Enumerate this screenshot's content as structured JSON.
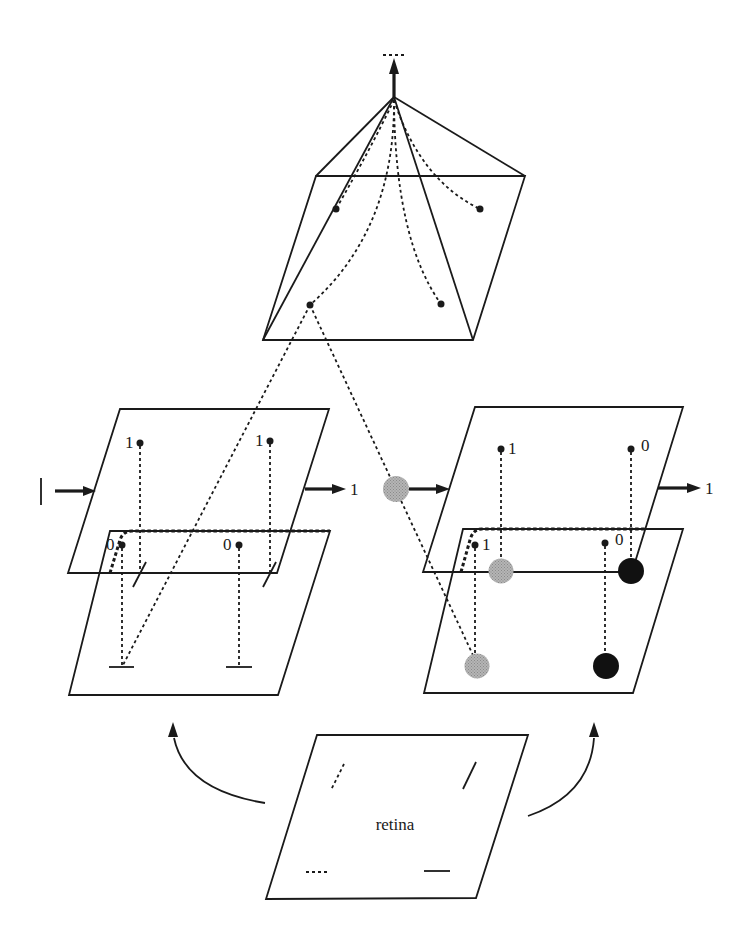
{
  "figure": {
    "type": "hierarchical feature-detection network diagram",
    "colors": {
      "ink": "#1a1a1a",
      "grey_unit": "#a8a8a8",
      "black_unit": "#111111",
      "background": "#ffffff"
    }
  },
  "pyramid": {
    "label": "top-level integrating unit",
    "output_symbol": "- - -"
  },
  "left_module": {
    "input_symbol": "|",
    "output_label": "1",
    "upper_plane_labels": [
      "1",
      "1"
    ],
    "lower_plane_labels": [
      "0",
      "0"
    ]
  },
  "right_module": {
    "input_symbol": "grey unit",
    "output_label": "1",
    "upper_plane_labels": [
      "1",
      "0"
    ],
    "lower_plane_labels": [
      "1",
      "0"
    ]
  },
  "retina": {
    "label": "retina",
    "features": [
      "dashed-oblique",
      "solid-oblique",
      "dashed-horizontal",
      "solid-horizontal"
    ]
  }
}
